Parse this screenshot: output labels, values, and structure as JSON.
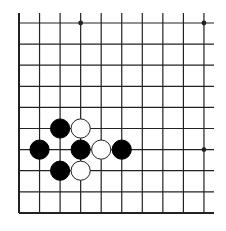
{
  "board": {
    "description": "Go board corner diagram (bottom-left corner, open top and right edges)",
    "columns": 10,
    "rows": 10,
    "colors": {
      "background": "#ffffff",
      "line": "#222222",
      "black_stone": "#000000",
      "white_stone": "#ffffff",
      "white_stone_outline": "#222222"
    },
    "star_points": [
      {
        "col": 3,
        "row": 0
      },
      {
        "col": 9,
        "row": 0
      },
      {
        "col": 9,
        "row": 6
      }
    ],
    "stones": [
      {
        "color": "black",
        "col": 2,
        "row": 5
      },
      {
        "color": "white",
        "col": 3,
        "row": 5
      },
      {
        "color": "black",
        "col": 1,
        "row": 6
      },
      {
        "color": "black",
        "col": 3,
        "row": 6
      },
      {
        "color": "white",
        "col": 4,
        "row": 6
      },
      {
        "color": "black",
        "col": 5,
        "row": 6
      },
      {
        "color": "black",
        "col": 2,
        "row": 7
      },
      {
        "color": "white",
        "col": 3,
        "row": 7
      }
    ]
  }
}
